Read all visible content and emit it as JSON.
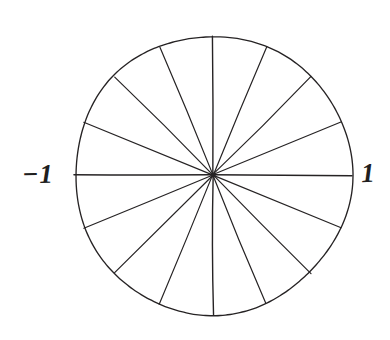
{
  "figure": {
    "kind": "hand-drawn geometric diagram",
    "background_color": "#ffffff",
    "stroke_color": "#262324",
    "stroke_width": 1.2,
    "circle": {
      "center_x": 213,
      "center_y": 175,
      "radius": 139
    },
    "spokes": {
      "count": 16,
      "angle_step_degrees": 22.5,
      "angles_degrees": [
        0,
        22.5,
        45,
        67.5,
        90,
        112.5,
        135,
        157.5,
        180,
        202.5,
        225,
        247.5,
        270,
        292.5,
        315,
        337.5
      ]
    },
    "labels": {
      "left": "−1",
      "right": "1"
    }
  },
  "chart_data": {
    "type": "pie",
    "title": "",
    "xlabel": "",
    "ylabel": "",
    "categories": [
      "s1",
      "s2",
      "s3",
      "s4",
      "s5",
      "s6",
      "s7",
      "s8",
      "s9",
      "s10",
      "s11",
      "s12",
      "s13",
      "s14",
      "s15",
      "s16"
    ],
    "values": [
      1,
      1,
      1,
      1,
      1,
      1,
      1,
      1,
      1,
      1,
      1,
      1,
      1,
      1,
      1,
      1
    ],
    "slice_angle_degrees": 22.5,
    "legend": "none",
    "grid": false,
    "annotations": [
      {
        "text": "−1",
        "x": -1,
        "y": 0,
        "position": "left-of-circle"
      },
      {
        "text": "1",
        "x": 1,
        "y": 0,
        "position": "right-of-circle"
      }
    ],
    "xlim": [
      -1,
      1
    ],
    "ylim": [
      -1,
      1
    ]
  }
}
